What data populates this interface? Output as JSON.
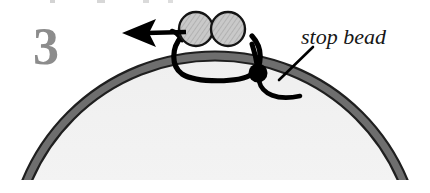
{
  "figure": {
    "width": 430,
    "height": 192,
    "background": "#ffffff"
  },
  "step": {
    "number": "3",
    "color": "#8c8c8c"
  },
  "callout": {
    "label": "stop bead",
    "text_color": "#161616",
    "leader_color": "#000000"
  },
  "cropped_text_above": {
    "note": "clipped descenders of a text line above the figure",
    "color": "#b4b4b4"
  },
  "hoop": {
    "name": "beading hoop",
    "band_color": "#6e6e6e",
    "outline_color": "#1a1a1a",
    "interior_color": "#fafafa",
    "band_width_px": 9
  },
  "beads": [
    {
      "name": "bead-left",
      "cx": 196,
      "cy": 29,
      "r": 17,
      "fill": "#c9c9c9",
      "outline": "#141414"
    },
    {
      "name": "bead-right",
      "cx": 228,
      "cy": 29,
      "r": 17,
      "fill": "#c9c9c9",
      "outline": "#141414"
    }
  ],
  "stop_bead": {
    "name": "stop-bead",
    "cx": 258,
    "cy": 73,
    "r": 9,
    "fill": "#000000"
  },
  "thread": {
    "name": "thread-loop",
    "color": "#000000",
    "stroke_px": 5
  },
  "arrow": {
    "name": "direction-arrow",
    "direction": "left",
    "color": "#000000",
    "tip_x": 122,
    "tail_x": 186,
    "y": 33
  }
}
